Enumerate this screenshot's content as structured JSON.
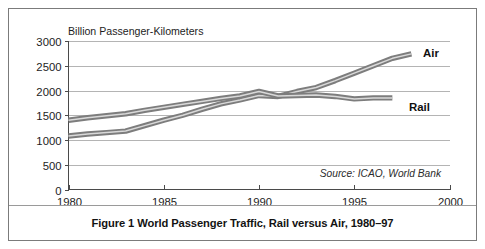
{
  "figure": {
    "caption": "Figure 1 World Passenger Traffic, Rail versus Air, 1980–97",
    "source_note": "Source: ICAO, World Bank",
    "frame_color": "#7b7b7b",
    "background_color": "#ffffff"
  },
  "chart_data": {
    "type": "line",
    "title": "",
    "subtitle": "",
    "xlabel": "",
    "ylabel": "Billion Passenger-Kilometers",
    "xlim": [
      1980,
      2000
    ],
    "ylim": [
      0,
      3000
    ],
    "xticks": [
      1980,
      1985,
      1990,
      1995,
      2000
    ],
    "xtick_labels": [
      "1980",
      "1985",
      "1990",
      "1995",
      "2000"
    ],
    "yticks": [
      0,
      500,
      1000,
      1500,
      2000,
      2500,
      3000
    ],
    "ytick_labels": [
      "0",
      "500",
      "1000",
      "1500",
      "2000",
      "2500",
      "3000"
    ],
    "grid": true,
    "grid_axis": "y",
    "legend_position": "inline-right-of-line-ends",
    "x": [
      1980,
      1981,
      1982,
      1983,
      1984,
      1985,
      1986,
      1987,
      1988,
      1989,
      1990,
      1991,
      1992,
      1993,
      1994,
      1995,
      1996,
      1997,
      1998
    ],
    "series": [
      {
        "name": "Air",
        "label": "Air",
        "color": "#7d7d7d",
        "values": [
          1080,
          1120,
          1150,
          1180,
          1290,
          1400,
          1500,
          1620,
          1730,
          1810,
          1900,
          1880,
          1980,
          2060,
          2200,
          2350,
          2500,
          2650,
          2740
        ]
      },
      {
        "name": "Rail",
        "label": "Rail",
        "color": "#7d7d7d",
        "values": [
          1400,
          1450,
          1490,
          1530,
          1600,
          1660,
          1720,
          1780,
          1840,
          1890,
          1980,
          1890,
          1900,
          1910,
          1880,
          1830,
          1850,
          1850,
          null
        ]
      }
    ],
    "annotations": [
      {
        "text": "Source: ICAO, World Bank",
        "x": 1997,
        "y": 380,
        "style": "italic"
      }
    ]
  },
  "labels": {
    "air": "Air",
    "rail": "Rail"
  }
}
